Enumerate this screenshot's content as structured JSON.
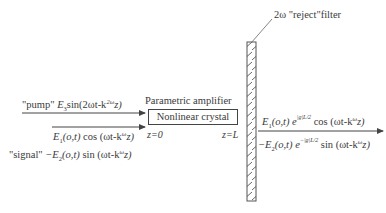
{
  "diagram": {
    "filter_label": "2ω \"reject\"filter",
    "amplifier_label": "Parametric amplifier",
    "crystal_label": "Nonlinear crystal",
    "z_start": "z=0",
    "z_end": "z=L",
    "pump": {
      "tag": "\"pump\"",
      "expr": "E₃sin(2ωt-k²ᵚ z)",
      "amp": "E",
      "amp_sub": "3",
      "func": "sin(2ωt-k",
      "k_sup": "2ω",
      "tail": "z)"
    },
    "signal_in_1": {
      "amp": "E",
      "amp_sub": "1",
      "args": "(o,t)",
      "func": " cos (ωt-k",
      "k_sup": "ω",
      "tail": "z)"
    },
    "signal_in_2": {
      "tag": "\"signal\"",
      "amp": "−E",
      "amp_sub": "2",
      "args": "(o,t)",
      "func": " sin (ωt-k",
      "k_sup": "ω",
      "tail": "z)"
    },
    "signal_out_1": {
      "amp": "E",
      "amp_sub": "1",
      "args": "(o,t) e",
      "exp": "|g|L/2",
      "func": "cos (ωt-k",
      "k_sup": "ω",
      "tail": "z)"
    },
    "signal_out_2": {
      "amp": "−E",
      "amp_sub": "2",
      "args": "(o,t) e",
      "exp": "−|g|L/2",
      "func": " sin (ωt-k",
      "k_sup": "ω",
      "tail": "z)"
    },
    "colors": {
      "line": "#444444",
      "text": "#3a3a3a",
      "background": "#ffffff"
    }
  }
}
